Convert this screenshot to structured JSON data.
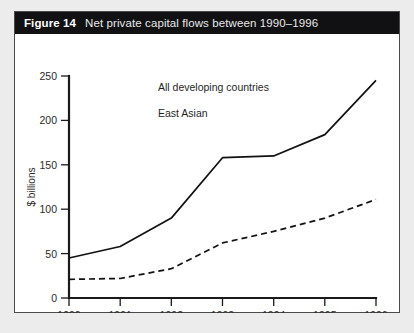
{
  "figure": {
    "number": "Figure 14",
    "caption": "Net private capital flows between 1990–1996"
  },
  "chart_data": {
    "type": "line",
    "title": "Net private capital flows between 1990–1996",
    "xlabel": "",
    "ylabel": "$ billions",
    "categories": [
      "1990",
      "1991",
      "1992",
      "1993",
      "1994",
      "1995",
      "1996"
    ],
    "x": [
      1990,
      1991,
      1992,
      1993,
      1994,
      1995,
      1996
    ],
    "series": [
      {
        "name": "All developing countries",
        "style": "solid",
        "values": [
          45,
          58,
          90,
          158,
          160,
          184,
          245
        ]
      },
      {
        "name": "East Asian",
        "style": "dashed",
        "values": [
          21,
          22,
          33,
          62,
          75,
          90,
          111
        ]
      }
    ],
    "ylim": [
      0,
      250
    ],
    "yticks": [
      0,
      50,
      100,
      150,
      200,
      250
    ],
    "ytick_labels": [
      "0",
      "50",
      "100",
      "150",
      "200",
      "250"
    ],
    "xtick_labels": [
      "1990",
      "1991",
      "1992",
      "1993",
      "1994",
      "1995",
      "1996"
    ],
    "grid": false,
    "legend": "inline-annotations",
    "annotations": [
      {
        "text": "All developing countries",
        "series": "All developing countries"
      },
      {
        "text": "East Asian",
        "series": "East Asian"
      }
    ],
    "colors": {
      "line": "#111111",
      "title_bar": "#111114",
      "background": "#ffffff"
    }
  }
}
